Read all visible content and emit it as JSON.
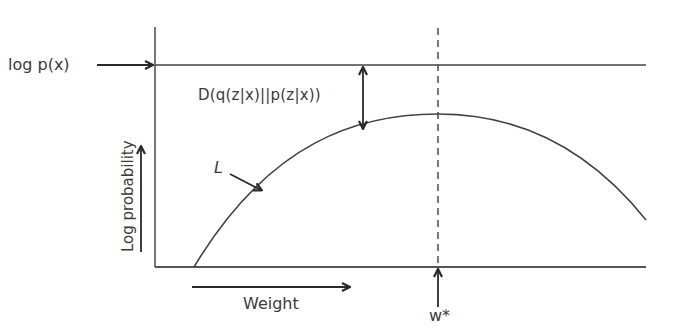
{
  "diagram": {
    "type": "variational-inference-lower-bound",
    "labels": {
      "log_px": "log p(x)",
      "kl_divergence": "D(q(z|x)||p(z|x))",
      "lower_bound": "L",
      "x_axis": "Weight",
      "y_axis": "Log probability",
      "optimum": "w*"
    },
    "elements": {
      "log_px_line": "horizontal line at log p(x)",
      "curve": "concave curve L (evidence lower bound) peaking at w*",
      "dashed_line": "vertical dashed line at w*",
      "kl_gap_arrow": "double-headed arrow between log p(x) and curve"
    },
    "colors": {
      "line": "#3a3a3a",
      "text": "#3b3b3b",
      "background": "#ffffff"
    }
  }
}
